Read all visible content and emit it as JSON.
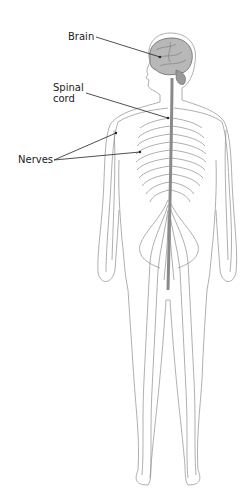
{
  "diagram": {
    "labels": {
      "brain": "Brain",
      "spinal_cord_line1": "Spinal",
      "spinal_cord_line2": "cord",
      "nerves": "Nerves"
    },
    "colors": {
      "background": "#ffffff",
      "outline": "#9a9a9a",
      "nerve": "#8c8c8c",
      "brain": "#777777",
      "leader": "#222222",
      "text": "#222222"
    }
  }
}
